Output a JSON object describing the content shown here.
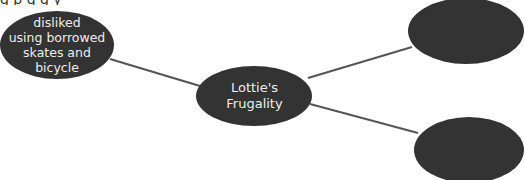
{
  "diagram": {
    "type": "concept-map",
    "top_cut_text": "g                         p                              g                                      g  y",
    "fill_color": "#333333",
    "text_color": "#eeeeee",
    "line_color": "#555555",
    "nodes": [
      {
        "id": "center",
        "label": "Lottie's\nFrugality",
        "lines": [
          "Lottie's",
          "Frugality"
        ],
        "cx": 254,
        "cy": 96,
        "rx": 58,
        "ry": 30
      },
      {
        "id": "left",
        "label": "disliked using borrowed skates and bicycle",
        "lines": [
          "disliked",
          "using borrowed",
          "skates and",
          "bicycle"
        ],
        "cx": 57,
        "cy": 45,
        "rx": 57,
        "ry": 34
      },
      {
        "id": "top-right",
        "label": "",
        "lines": [],
        "cx": 466,
        "cy": 31,
        "rx": 58,
        "ry": 33
      },
      {
        "id": "bottom-right",
        "label": "",
        "lines": [],
        "cx": 469,
        "cy": 150,
        "rx": 55,
        "ry": 33
      }
    ],
    "edges": [
      {
        "from": "left",
        "to": "center",
        "x1": 110,
        "y1": 59,
        "x2": 200,
        "y2": 86
      },
      {
        "from": "center",
        "to": "top-right",
        "x1": 308,
        "y1": 78,
        "x2": 412,
        "y2": 47
      },
      {
        "from": "center",
        "to": "bottom-right",
        "x1": 310,
        "y1": 104,
        "x2": 418,
        "y2": 133
      }
    ]
  }
}
